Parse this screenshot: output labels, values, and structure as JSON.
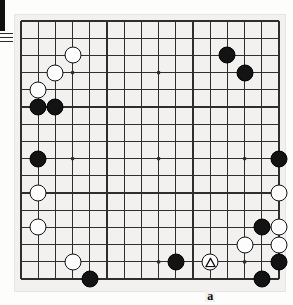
{
  "figure": {
    "kind": "go-board-diagram",
    "board_size": 19,
    "visible_cols": 16,
    "visible_rows": 16,
    "background_color": "#f2f1ef",
    "line_color": "#2e2e2e",
    "black_color": "#131313",
    "white_color": "#fdfdfd"
  },
  "gutter": {
    "bar_color": "#111111",
    "rule_count": 3
  },
  "grid": {
    "origin_x": 7,
    "origin_y": 7,
    "spacing": 17.2,
    "cols": 16,
    "rows": 16,
    "star_points": [
      {
        "col": 3,
        "row": 3
      },
      {
        "col": 8,
        "row": 3
      },
      {
        "col": 3,
        "row": 8
      },
      {
        "col": 8,
        "row": 8
      },
      {
        "col": 13,
        "row": 8
      },
      {
        "col": 13,
        "row": 14
      },
      {
        "col": 8,
        "row": 14
      }
    ]
  },
  "stones": [
    {
      "color": "white",
      "col": 3,
      "row": 2,
      "mark": null
    },
    {
      "color": "white",
      "col": 2,
      "row": 3,
      "mark": null
    },
    {
      "color": "white",
      "col": 1,
      "row": 4,
      "mark": null
    },
    {
      "color": "black",
      "col": 1,
      "row": 5,
      "mark": null
    },
    {
      "color": "black",
      "col": 2,
      "row": 5,
      "mark": null
    },
    {
      "color": "black",
      "col": 12,
      "row": 2,
      "mark": null
    },
    {
      "color": "black",
      "col": 13,
      "row": 3,
      "mark": null
    },
    {
      "color": "black",
      "col": 1,
      "row": 8,
      "mark": null
    },
    {
      "color": "black",
      "col": 15,
      "row": 8,
      "mark": null
    },
    {
      "color": "white",
      "col": 1,
      "row": 10,
      "mark": null
    },
    {
      "color": "white",
      "col": 15,
      "row": 10,
      "mark": null
    },
    {
      "color": "black",
      "col": 14,
      "row": 12,
      "mark": null
    },
    {
      "color": "white",
      "col": 15,
      "row": 12,
      "mark": null
    },
    {
      "color": "white",
      "col": 1,
      "row": 12,
      "mark": null
    },
    {
      "color": "white",
      "col": 13,
      "row": 13,
      "mark": null
    },
    {
      "color": "white",
      "col": 15,
      "row": 13,
      "mark": null
    },
    {
      "color": "white",
      "col": 3,
      "row": 14,
      "mark": null
    },
    {
      "color": "black",
      "col": 9,
      "row": 14,
      "mark": null
    },
    {
      "color": "white",
      "col": 11,
      "row": 14,
      "mark": "triangle"
    },
    {
      "color": "black",
      "col": 15,
      "row": 14,
      "mark": null
    },
    {
      "color": "black",
      "col": 4,
      "row": 15,
      "mark": null
    },
    {
      "color": "black",
      "col": 14,
      "row": 15,
      "mark": null
    }
  ],
  "labels": [
    {
      "text": "a",
      "col": 11,
      "row": 16
    }
  ]
}
